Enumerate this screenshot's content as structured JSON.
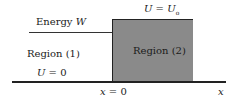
{
  "diagram": {
    "energy_label": "Energy W",
    "energy_label_parts": {
      "text": "Energy ",
      "var": "W"
    },
    "barrier_label": {
      "lhs": "U",
      "eq": " = ",
      "rhs": "U",
      "sub": "o"
    },
    "region1_label": "Region (1)",
    "region1_potential": {
      "lhs": "U",
      "eq": " = ",
      "rhs": "0"
    },
    "region2_label": "Region (2)",
    "origin_label": {
      "lhs": "x",
      "eq": " = ",
      "rhs": "0"
    },
    "axis_label": "x",
    "colors": {
      "region2_fill": "#8a8a8a",
      "line": "#222222",
      "background": "#ffffff"
    }
  }
}
